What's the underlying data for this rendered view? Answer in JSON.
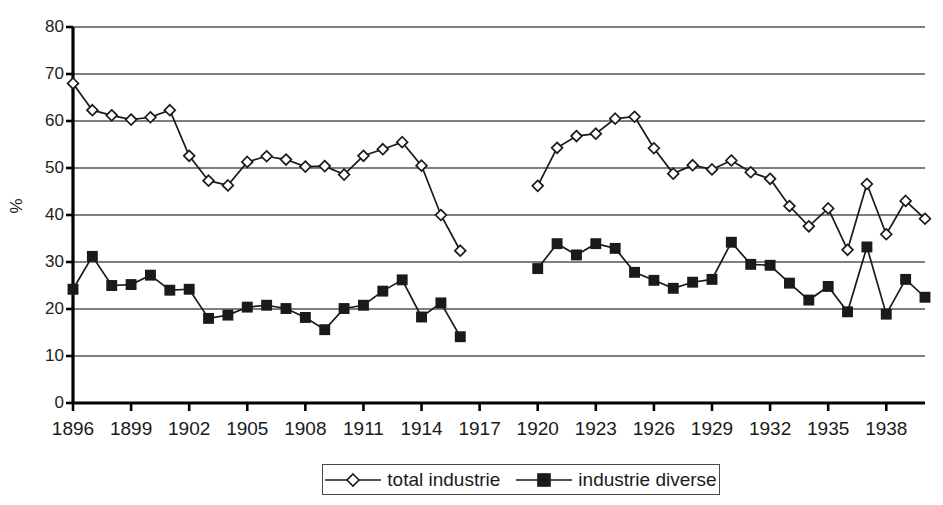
{
  "chart_data": {
    "type": "line",
    "title": "",
    "subtitle": "",
    "xlabel": "",
    "ylabel": "%",
    "ylim": [
      0,
      80
    ],
    "ytick_step": 10,
    "yticks": [
      0,
      10,
      20,
      30,
      40,
      50,
      60,
      70,
      80
    ],
    "xlim": [
      1896,
      1940
    ],
    "xticks": [
      1896,
      1899,
      1902,
      1905,
      1908,
      1911,
      1914,
      1917,
      1920,
      1923,
      1926,
      1929,
      1932,
      1935,
      1938
    ],
    "xtick_labels": [
      "1896",
      "1899",
      "1902",
      "1905",
      "1908",
      "1911",
      "1914",
      "1917",
      "1920",
      "1923",
      "1926",
      "1929",
      "1932",
      "1935",
      "1938"
    ],
    "grid": "horizontal",
    "legend_position": "bottom-center",
    "gap_note": "Both series break between 1916 and 1920 (no data for 1917-1919)",
    "series": [
      {
        "name": "total industrie",
        "marker": "diamond-open",
        "color": "#1a1a1a",
        "segments": [
          {
            "x": [
              1896,
              1897,
              1898,
              1899,
              1900,
              1901,
              1902,
              1903,
              1904,
              1905,
              1906,
              1907,
              1908,
              1909,
              1910,
              1911,
              1912,
              1913,
              1914,
              1915,
              1916
            ],
            "y": [
              68.0,
              62.3,
              61.2,
              60.3,
              60.8,
              62.3,
              52.6,
              47.3,
              46.3,
              51.3,
              52.5,
              51.8,
              50.3,
              50.4,
              48.6,
              52.6,
              54.0,
              55.5,
              50.5,
              40.0,
              32.4
            ]
          },
          {
            "x": [
              1920,
              1921,
              1922,
              1923,
              1924,
              1925,
              1926,
              1927,
              1928,
              1929,
              1930,
              1931,
              1932,
              1933,
              1934,
              1935,
              1936,
              1937,
              1938,
              1939,
              1940
            ],
            "y": [
              46.2,
              54.3,
              56.8,
              57.3,
              60.5,
              60.9,
              54.2,
              48.8,
              50.6,
              49.7,
              51.6,
              49.1,
              47.7,
              41.9,
              37.6,
              41.4,
              32.6,
              46.6,
              35.9,
              43.0,
              39.2
            ]
          }
        ]
      },
      {
        "name": "industrie diverse",
        "marker": "square-filled",
        "color": "#1a1a1a",
        "segments": [
          {
            "x": [
              1896,
              1897,
              1898,
              1899,
              1900,
              1901,
              1902,
              1903,
              1904,
              1905,
              1906,
              1907,
              1908,
              1909,
              1910,
              1911,
              1912,
              1913,
              1914,
              1915,
              1916
            ],
            "y": [
              24.2,
              31.2,
              25.0,
              25.2,
              27.2,
              24.0,
              24.2,
              18.0,
              18.7,
              20.4,
              20.8,
              20.1,
              18.2,
              15.6,
              20.1,
              20.8,
              23.8,
              26.2,
              18.3,
              21.3,
              14.1
            ]
          },
          {
            "x": [
              1920,
              1921,
              1922,
              1923,
              1924,
              1925,
              1926,
              1927,
              1928,
              1929,
              1930,
              1931,
              1932,
              1933,
              1934,
              1935,
              1936,
              1937,
              1938,
              1939,
              1940
            ],
            "y": [
              28.6,
              33.9,
              31.5,
              33.9,
              32.9,
              27.8,
              26.1,
              24.4,
              25.7,
              26.3,
              34.2,
              29.5,
              29.3,
              25.5,
              21.9,
              24.8,
              19.4,
              33.2,
              18.9,
              26.3,
              22.5
            ]
          }
        ]
      }
    ]
  },
  "axis": {
    "y_title": "%",
    "y_tick_labels": [
      "80",
      "70",
      "60",
      "50",
      "40",
      "30",
      "20",
      "10",
      "0"
    ],
    "x_tick_labels": [
      "1896",
      "1899",
      "1902",
      "1905",
      "1908",
      "1911",
      "1914",
      "1917",
      "1920",
      "1923",
      "1926",
      "1929",
      "1932",
      "1935",
      "1938"
    ]
  },
  "legend": {
    "items": [
      {
        "label": "total industrie",
        "marker": "diamond-open"
      },
      {
        "label": "industrie diverse",
        "marker": "square-filled"
      }
    ]
  },
  "colors": {
    "line": "#1a1a1a",
    "grid": "#555555",
    "axis": "#000000",
    "background": "#ffffff"
  }
}
